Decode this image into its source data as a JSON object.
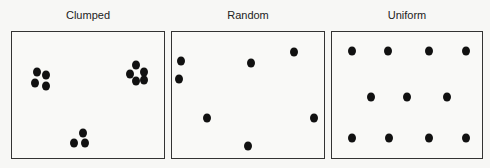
{
  "panels": [
    {
      "title": "Clumped",
      "box": {
        "x": 11,
        "y": 31,
        "w": 154,
        "h": 129
      },
      "dots": [
        [
          37,
          72
        ],
        [
          46,
          75
        ],
        [
          35,
          83
        ],
        [
          46,
          86
        ],
        [
          136,
          65
        ],
        [
          130,
          74
        ],
        [
          144,
          72
        ],
        [
          136,
          81
        ],
        [
          144,
          80
        ],
        [
          83,
          133
        ],
        [
          74,
          143
        ],
        [
          85,
          143
        ]
      ]
    },
    {
      "title": "Random",
      "box": {
        "x": 171,
        "y": 31,
        "w": 154,
        "h": 129
      },
      "dots": [
        [
          181,
          61
        ],
        [
          179,
          79
        ],
        [
          251,
          63
        ],
        [
          294,
          52
        ],
        [
          207,
          118
        ],
        [
          314,
          118
        ],
        [
          248,
          146
        ]
      ]
    },
    {
      "title": "Uniform",
      "box": {
        "x": 331,
        "y": 31,
        "w": 152,
        "h": 128
      },
      "dots": [
        [
          352,
          51
        ],
        [
          388,
          51
        ],
        [
          429,
          51
        ],
        [
          466,
          51
        ],
        [
          371,
          97
        ],
        [
          407,
          97
        ],
        [
          447,
          97
        ],
        [
          352,
          138
        ],
        [
          389,
          138
        ],
        [
          429,
          138
        ],
        [
          466,
          138
        ]
      ]
    }
  ],
  "colors": {
    "dot": "#111111",
    "border": "#333333",
    "background": "#f7f7f5"
  }
}
